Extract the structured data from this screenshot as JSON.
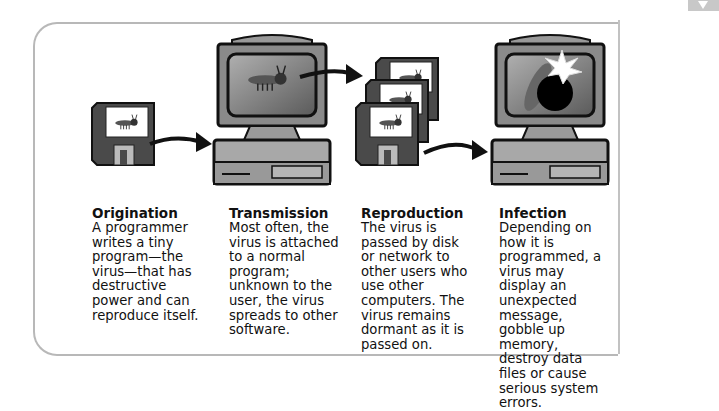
{
  "diagram": {
    "topic": "Computer virus life cycle",
    "stages": [
      {
        "title": "Origination",
        "text": "A programmer writes a tiny program—the virus—that has destructive power and can reproduce itself.",
        "illustration": "floppy-disk-with-bug"
      },
      {
        "title": "Transmission",
        "text": "Most often, the virus is attached to a normal program; unknown to the user, the virus spreads to other software.",
        "illustration": "computer-with-bug"
      },
      {
        "title": "Reproduction",
        "text": "The virus is passed by disk or network to other users who use other computers. The virus remains dormant as it is passed on.",
        "illustration": "stack-of-floppy-disks-with-bugs"
      },
      {
        "title": "Infection",
        "text": "Depending on how it is programmed, a virus may display an unexpected message, gobble up memory, destroy data files or cause serious system errors.",
        "illustration": "computer-with-bomb"
      }
    ],
    "colors": {
      "frame": "#b8b8b8",
      "ink": "#111111",
      "disk": "#4a4a4a",
      "screen": "#8a8a8a"
    }
  }
}
